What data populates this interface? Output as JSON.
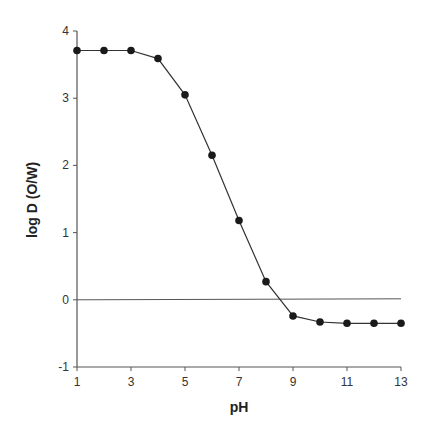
{
  "chart_data": {
    "type": "line",
    "title": "",
    "xlabel": "pH",
    "ylabel": "log D (O/W)",
    "x": [
      1,
      2,
      3,
      4,
      5,
      6,
      7,
      8,
      9,
      10,
      11,
      12,
      13
    ],
    "series": [
      {
        "name": "log D",
        "values": [
          3.71,
          3.71,
          3.71,
          3.59,
          3.05,
          2.15,
          1.18,
          0.27,
          -0.24,
          -0.33,
          -0.35,
          -0.35,
          -0.35
        ]
      }
    ],
    "xlim": [
      1,
      13
    ],
    "ylim": [
      -1,
      4
    ],
    "xticks": [
      1,
      3,
      5,
      7,
      9,
      11,
      13
    ],
    "yticks": [
      -1,
      0,
      1,
      2,
      3,
      4
    ],
    "reference_line": {
      "y": 0,
      "from_x": 1,
      "to_x": 13
    },
    "grid": false,
    "legend": null,
    "colors": {
      "line": "#333333",
      "marker": "#1a1a1a",
      "axis": "#555555"
    }
  }
}
